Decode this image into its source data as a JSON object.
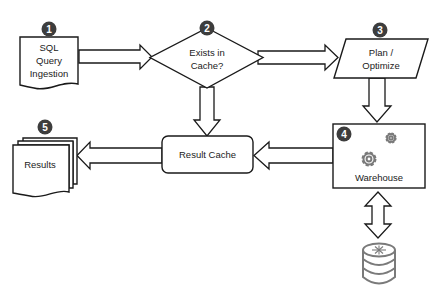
{
  "diagram": {
    "colors": {
      "stroke": "#1a1a1a",
      "badge": "#3d3d3d",
      "badge_text": "#ffffff",
      "icon": "#7a7a7a",
      "background": "#ffffff"
    },
    "nodes": {
      "ingestion": {
        "badge": "1",
        "shape": "document",
        "lines": [
          "SQL",
          "Query",
          "Ingestion"
        ]
      },
      "cache_check": {
        "badge": "2",
        "shape": "decision",
        "lines": [
          "Exists in",
          "Cache?"
        ]
      },
      "plan": {
        "badge": "3",
        "shape": "parallelogram",
        "lines": [
          "Plan /",
          "Optimize"
        ]
      },
      "warehouse": {
        "badge": "4",
        "shape": "rectangle",
        "icon": "gears-icon",
        "label": "Warehouse"
      },
      "results": {
        "badge": "5",
        "shape": "multi-document",
        "label": "Results"
      },
      "result_cache": {
        "shape": "rounded-rectangle",
        "label": "Result Cache"
      },
      "storage": {
        "shape": "database",
        "icon": "database-icon"
      }
    },
    "edges": [
      {
        "from": "ingestion",
        "to": "cache_check",
        "direction": "right"
      },
      {
        "from": "cache_check",
        "to": "plan",
        "direction": "right"
      },
      {
        "from": "cache_check",
        "to": "result_cache",
        "direction": "down"
      },
      {
        "from": "plan",
        "to": "warehouse",
        "direction": "down"
      },
      {
        "from": "warehouse",
        "to": "result_cache",
        "direction": "left"
      },
      {
        "from": "result_cache",
        "to": "results",
        "direction": "left"
      },
      {
        "from": "warehouse",
        "to": "storage",
        "direction": "bidirectional-vertical"
      }
    ]
  }
}
